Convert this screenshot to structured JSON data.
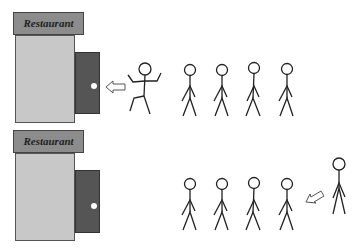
{
  "scenes": [
    {
      "id": "top",
      "sign_label": "Restaurant",
      "door": "open-entry",
      "entering_person": "dancing",
      "queue_count": 4,
      "arrow_direction": "left"
    },
    {
      "id": "bottom",
      "sign_label": "Restaurant",
      "door": "closed",
      "approaching_person": "walking",
      "queue_count": 4,
      "arrow_direction": "down-left"
    }
  ],
  "colors": {
    "sign": "#8c8c8c",
    "building": "#c8c8c8",
    "door": "#555555",
    "stroke": "#222222"
  }
}
